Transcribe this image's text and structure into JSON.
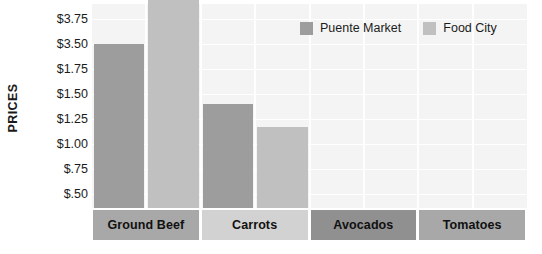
{
  "chart_data": {
    "type": "bar",
    "title": "",
    "xlabel": "",
    "ylabel": "PRICES",
    "categories": [
      "Ground Beef",
      "Carrots",
      "Avocados",
      "Tomatoes"
    ],
    "y_tick_labels": [
      "$3.75",
      "$3.50",
      "$1.75",
      "$1.50",
      "$1.25",
      "$1.00",
      "$.75",
      "$.50"
    ],
    "y_tick_values": [
      3.75,
      3.5,
      1.75,
      1.5,
      1.25,
      1.0,
      0.75,
      0.5
    ],
    "ylim": [
      0.375,
      3.875
    ],
    "grid": true,
    "legend_position": "top-right",
    "series": [
      {
        "name": "Puente Market",
        "color": "#9d9d9d",
        "values": [
          3.5,
          1.4,
          null,
          null
        ],
        "value_labels": [
          "$3.50",
          "$1.40",
          "",
          ""
        ]
      },
      {
        "name": "Food City",
        "color": "#c0c0c0",
        "values": [
          3.95,
          1.17,
          null,
          null
        ],
        "value_labels": [
          "$3.95",
          "$1.17",
          "",
          ""
        ]
      }
    ],
    "annotations": []
  },
  "legend": {
    "entries": [
      {
        "label": "Puente Market",
        "color": "#9d9d9d"
      },
      {
        "label": "Food City",
        "color": "#c0c0c0"
      }
    ]
  },
  "axis": {
    "y_title": "PRICES",
    "ticks": [
      "$3.75",
      "$3.50",
      "$1.75",
      "$1.50",
      "$1.25",
      "$1.00",
      "$.75",
      "$.50"
    ]
  },
  "category_bands": [
    {
      "label": "Ground Beef",
      "color": "#a8a8a8"
    },
    {
      "label": "Carrots",
      "color": "#d2d2d2"
    },
    {
      "label": "Avocados",
      "color": "#909090"
    },
    {
      "label": "Tomatoes",
      "color": "#a8a8a8"
    }
  ],
  "plot": {
    "background": "#f4f4f4",
    "gridline_color": "#ffffff"
  }
}
